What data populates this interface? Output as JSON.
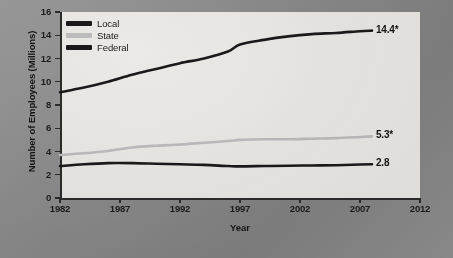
{
  "chart_data": {
    "type": "line",
    "title": "",
    "xlabel": "Year",
    "ylabel": "Number of Employees (Millions)",
    "xlim": [
      1982,
      2012
    ],
    "ylim": [
      0,
      16
    ],
    "grid": false,
    "legend_position": "top-left inside plot",
    "xticks": [
      "1982",
      "1987",
      "1992",
      "1997",
      "2002",
      "2007",
      "2012"
    ],
    "yticks": [
      "0",
      "2",
      "4",
      "6",
      "8",
      "10",
      "12",
      "14",
      "16"
    ],
    "series": [
      {
        "name": "Local",
        "color": "#1a1a1a",
        "end_label": "14.4*",
        "x": [
          1982,
          1984,
          1986,
          1988,
          1990,
          1992,
          1994,
          1996,
          1997,
          1999,
          2001,
          2003,
          2005,
          2007,
          2008
        ],
        "values": [
          9.1,
          9.5,
          10.0,
          10.6,
          11.1,
          11.6,
          12.0,
          12.6,
          13.2,
          13.6,
          13.9,
          14.1,
          14.2,
          14.35,
          14.4
        ]
      },
      {
        "name": "State",
        "color": "#bdbdbd",
        "end_label": "5.3*",
        "x": [
          1982,
          1984,
          1986,
          1988,
          1990,
          1992,
          1994,
          1996,
          1997,
          1999,
          2001,
          2003,
          2005,
          2007,
          2008
        ],
        "values": [
          3.7,
          3.85,
          4.05,
          4.35,
          4.5,
          4.6,
          4.75,
          4.9,
          5.0,
          5.05,
          5.05,
          5.1,
          5.15,
          5.25,
          5.3
        ]
      },
      {
        "name": "Federal",
        "color": "#1a1a1a",
        "end_label": "2.8",
        "x": [
          1982,
          1984,
          1986,
          1988,
          1990,
          1992,
          1994,
          1996,
          1997,
          1999,
          2001,
          2003,
          2005,
          2007,
          2008
        ],
        "values": [
          2.75,
          2.9,
          3.0,
          3.0,
          2.95,
          2.9,
          2.85,
          2.75,
          2.72,
          2.75,
          2.78,
          2.8,
          2.82,
          2.88,
          2.9
        ]
      }
    ]
  },
  "legend": {
    "items": [
      {
        "label": "Local"
      },
      {
        "label": "State"
      },
      {
        "label": "Federal"
      }
    ]
  },
  "axes": {
    "y_title": "Number of Employees (Millions)",
    "x_title": "Year"
  },
  "end_labels": {
    "local": "14.4*",
    "state": "5.3*",
    "federal": "2.8"
  },
  "colors": {
    "background": "#8d8d8d",
    "plot_background": "#eceae7",
    "axis": "#2b2b2b",
    "local": "#1a1a1a",
    "state": "#bdbdbd",
    "federal": "#1a1a1a"
  }
}
